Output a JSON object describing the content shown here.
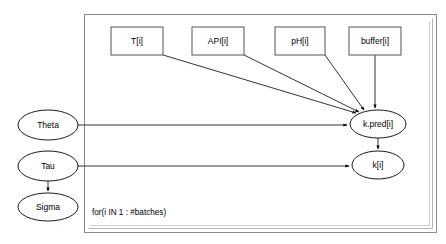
{
  "diagram": {
    "type": "directed-acyclic-graph",
    "plate": {
      "label": "for(i IN 1 : #batches)",
      "x": 84,
      "y": 14,
      "width": 352,
      "height": 218
    },
    "nodes": [
      {
        "id": "T",
        "label": "T[i]",
        "shape": "rect",
        "cx": 137,
        "cy": 41,
        "w": 52,
        "h": 28
      },
      {
        "id": "API",
        "label": "API[i]",
        "shape": "rect",
        "cx": 218,
        "cy": 41,
        "w": 52,
        "h": 28
      },
      {
        "id": "pH",
        "label": "pH[i]",
        "shape": "rect",
        "cx": 300,
        "cy": 41,
        "w": 50,
        "h": 28
      },
      {
        "id": "buffer",
        "label": "buffer[i]",
        "shape": "rect",
        "cx": 375,
        "cy": 41,
        "w": 52,
        "h": 28
      },
      {
        "id": "Theta",
        "label": "Theta",
        "shape": "ellipse",
        "cx": 48,
        "cy": 125,
        "w": 60,
        "h": 30
      },
      {
        "id": "Tau",
        "label": "Tau",
        "shape": "ellipse",
        "cx": 48,
        "cy": 166,
        "w": 60,
        "h": 30
      },
      {
        "id": "Sigma",
        "label": "Sigma",
        "shape": "ellipse",
        "cx": 48,
        "cy": 207,
        "w": 60,
        "h": 28
      },
      {
        "id": "kpred",
        "label": "k.pred[i]",
        "shape": "ellipse",
        "cx": 378,
        "cy": 124,
        "w": 56,
        "h": 28
      },
      {
        "id": "k",
        "label": "k[i]",
        "shape": "ellipse",
        "cx": 378,
        "cy": 165,
        "w": 52,
        "h": 28
      }
    ],
    "edges": [
      {
        "from": "T",
        "to": "kpred"
      },
      {
        "from": "API",
        "to": "kpred"
      },
      {
        "from": "pH",
        "to": "kpred"
      },
      {
        "from": "buffer",
        "to": "kpred"
      },
      {
        "from": "Theta",
        "to": "kpred"
      },
      {
        "from": "Tau",
        "to": "k"
      },
      {
        "from": "kpred",
        "to": "k"
      },
      {
        "from": "Tau",
        "to": "Sigma"
      }
    ],
    "colors": {
      "background": "#ffffff",
      "node_stroke": "#000000",
      "box_stroke": "#555555",
      "edge": "#000000",
      "plate": "#8a8a8a"
    }
  }
}
